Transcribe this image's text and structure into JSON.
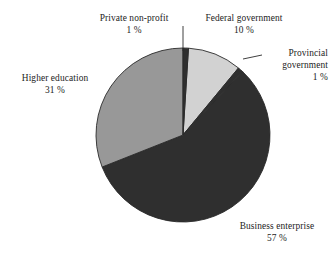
{
  "chart_data": {
    "type": "pie",
    "title": "",
    "subtitle": "",
    "xlabel": "",
    "ylabel": "",
    "legend_position": "none",
    "grid": false,
    "unit": "%",
    "categories": [
      "Federal government",
      "Provincial government",
      "Business enterprise",
      "Higher education",
      "Private non-profit"
    ],
    "values": [
      10,
      1,
      57,
      31,
      1
    ],
    "slices": [
      {
        "label": "Federal government",
        "value": 10,
        "value_text": "10 %",
        "color": "#d2d2d2",
        "start_angle": 3.6,
        "end_angle": 39.6,
        "label_position": "top-right",
        "has_leader_line": false
      },
      {
        "label": "Provincial government",
        "value": 1,
        "value_text": "1 %",
        "color": "#2f2f2f",
        "start_angle": 39.6,
        "end_angle": 43.2,
        "label_position": "right",
        "has_leader_line": true
      },
      {
        "label": "Business enterprise",
        "value": 57,
        "value_text": "57 %",
        "color": "#2f2f2f",
        "start_angle": 43.2,
        "end_angle": 248.4,
        "label_position": "bottom-right",
        "has_leader_line": false
      },
      {
        "label": "Higher education",
        "value": 31,
        "value_text": "31 %",
        "color": "#989898",
        "start_angle": 248.4,
        "end_angle": 360.0,
        "label_position": "left",
        "has_leader_line": false
      },
      {
        "label": "Private non-profit",
        "value": 1,
        "value_text": "1 %",
        "color": "#2f2f2f",
        "start_angle": 0.0,
        "end_angle": 3.6,
        "label_position": "top",
        "has_leader_line": true
      }
    ],
    "geometry": {
      "center_x": 183,
      "center_y": 135,
      "radius": 87
    },
    "colors": {
      "background": "#ffffff",
      "text": "#1d1d1d",
      "outline": "#2a2a2a",
      "light_gray": "#d2d2d2",
      "medium_gray": "#989898",
      "dark": "#2f2f2f"
    }
  },
  "labels": {
    "private_non_profit": {
      "title": "Private non-profit",
      "value": "1 %"
    },
    "federal_government": {
      "title": "Federal government",
      "value": "10 %"
    },
    "provincial_government": {
      "title_line1": "Provincial",
      "title_line2": "government",
      "value": "1 %"
    },
    "higher_education": {
      "title": "Higher education",
      "value": "31 %"
    },
    "business_enterprise": {
      "title": "Business enterprise",
      "value": "57 %"
    }
  }
}
